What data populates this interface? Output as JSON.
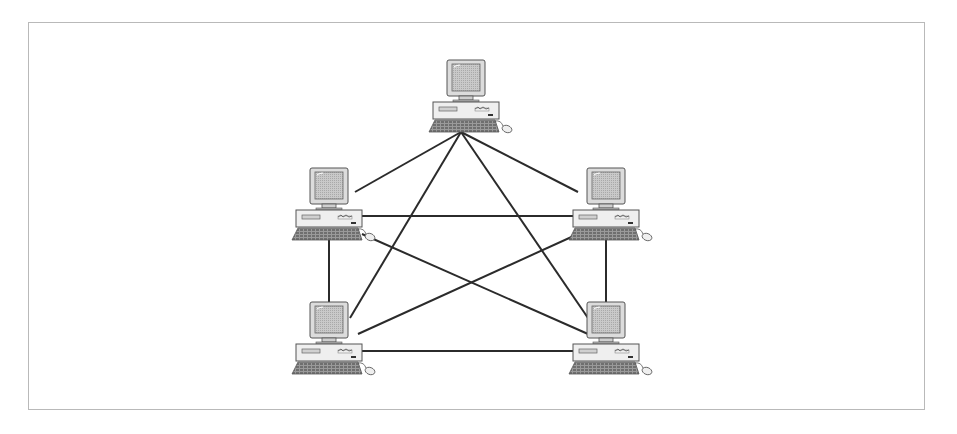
{
  "diagram": {
    "type": "full-mesh-network",
    "frame": {
      "x": 28,
      "y": 22,
      "width": 897,
      "height": 388,
      "border_color": "#b9b9b9"
    },
    "colors": {
      "line": "#2b2b2b",
      "monitor_bezel": "#d8d8d8",
      "screen": "#bdbdbd",
      "case": "#ececec",
      "outline": "#555555",
      "keyboard": "#8a8a8a"
    },
    "nodes": [
      {
        "id": "top",
        "label": "",
        "icon": "desktop-computer-icon",
        "x": 425,
        "y": 58
      },
      {
        "id": "upper-left",
        "label": "",
        "icon": "desktop-computer-icon",
        "x": 288,
        "y": 166
      },
      {
        "id": "upper-right",
        "label": "",
        "icon": "desktop-computer-icon",
        "x": 565,
        "y": 166
      },
      {
        "id": "lower-left",
        "label": "",
        "icon": "desktop-computer-icon",
        "x": 288,
        "y": 300
      },
      {
        "id": "lower-right",
        "label": "",
        "icon": "desktop-computer-icon",
        "x": 565,
        "y": 300
      }
    ],
    "links": [
      {
        "from": "top",
        "to": "upper-left",
        "x1": 461,
        "y1": 132,
        "x2": 355,
        "y2": 192
      },
      {
        "from": "top",
        "to": "upper-right",
        "x1": 461,
        "y1": 132,
        "x2": 578,
        "y2": 192
      },
      {
        "from": "top",
        "to": "lower-left",
        "x1": 461,
        "y1": 132,
        "x2": 350,
        "y2": 318
      },
      {
        "from": "top",
        "to": "lower-right",
        "x1": 461,
        "y1": 132,
        "x2": 588,
        "y2": 318
      },
      {
        "from": "upper-left",
        "to": "upper-right",
        "x1": 362,
        "y1": 216,
        "x2": 574,
        "y2": 216
      },
      {
        "from": "lower-left",
        "to": "lower-right",
        "x1": 362,
        "y1": 351,
        "x2": 574,
        "y2": 351
      },
      {
        "from": "upper-left",
        "to": "lower-left",
        "x1": 329,
        "y1": 240,
        "x2": 329,
        "y2": 302
      },
      {
        "from": "upper-right",
        "to": "lower-right",
        "x1": 606,
        "y1": 240,
        "x2": 606,
        "y2": 302
      },
      {
        "from": "upper-left",
        "to": "lower-right",
        "x1": 362,
        "y1": 234,
        "x2": 588,
        "y2": 334
      },
      {
        "from": "upper-right",
        "to": "lower-left",
        "x1": 578,
        "y1": 234,
        "x2": 358,
        "y2": 334
      }
    ]
  }
}
